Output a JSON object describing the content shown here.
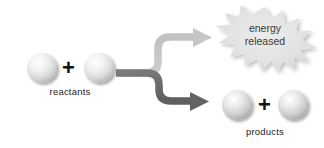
{
  "figure": {
    "background_color": "#ffffff"
  },
  "reactants": {
    "label": "reactants",
    "sphere_count": 2,
    "operator": "+",
    "spheres": [
      {
        "name": "reactant-sphere-1",
        "cx": 42,
        "cy": 68,
        "r": 15
      },
      {
        "name": "reactant-sphere-2",
        "cx": 99,
        "cy": 68,
        "r": 15
      }
    ],
    "sphere_color": "#d8d8d8",
    "sphere_highlight": "#fdfdfd"
  },
  "products": {
    "label": "products",
    "sphere_count": 2,
    "operator": "+",
    "spheres": [
      {
        "name": "product-sphere-1",
        "cx": 237,
        "cy": 105,
        "r": 15
      },
      {
        "name": "product-sphere-2",
        "cx": 293,
        "cy": 105,
        "r": 15
      }
    ],
    "sphere_color": "#d2d2d2",
    "sphere_highlight": "#fafafa"
  },
  "arrows": {
    "energy_branch": {
      "name": "energy-arrow",
      "color": "#c9c9c9",
      "direction": "up-right"
    },
    "products_branch": {
      "name": "products-arrow",
      "color": "#6e6e6e",
      "direction": "down-right"
    },
    "stem_color": "#777777"
  },
  "energy_burst": {
    "line1": "energy",
    "line2": "released",
    "fill_color": "#e2e2e2",
    "text_color": "#3a3a3a",
    "points": 16,
    "center": {
      "cx": 265,
      "cy": 36
    }
  }
}
